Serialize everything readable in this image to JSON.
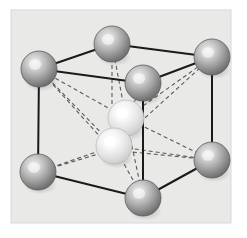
{
  "figure": {
    "name": "crystal-unit-cell-diagram",
    "canvas": {
      "width": 247,
      "height": 238
    },
    "background_color": "#ffffff",
    "panel": {
      "x": 11,
      "y": 10,
      "width": 220,
      "height": 213,
      "fill": "#e9e9e7",
      "stroke": "#d8d8d6"
    }
  },
  "style": {
    "solid_edge_color": "#1a1a1a",
    "solid_edge_width": 2.0,
    "dashed_edge_color": "#5a5a5a",
    "dashed_edge_width": 1.1,
    "dash_pattern": "4 3",
    "corner_atom_color_light": "#e2e2e2",
    "corner_atom_color_mid": "#a8a8a8",
    "corner_atom_color_dark": "#6e6e6e",
    "corner_atom_rim": "#5c5c5c",
    "interior_atom_color_light": "#ffffff",
    "interior_atom_color_mid": "#ebebeb",
    "interior_atom_color_dark": "#c4c4c4",
    "interior_atom_rim": "#b6b6b6",
    "shadow_color": "#00000022"
  },
  "atoms": [
    {
      "id": "corner-back-left",
      "label": "corner atom back left",
      "cx": 39,
      "cy": 69,
      "r": 18,
      "kind": "corner"
    },
    {
      "id": "corner-back-top",
      "label": "corner atom back top",
      "cx": 112,
      "cy": 44,
      "r": 18,
      "kind": "corner"
    },
    {
      "id": "corner-back-right",
      "label": "corner atom back right",
      "cx": 212,
      "cy": 57,
      "r": 18,
      "kind": "corner"
    },
    {
      "id": "corner-front-top",
      "label": "corner atom front top",
      "cx": 143,
      "cy": 83,
      "r": 18,
      "kind": "corner"
    },
    {
      "id": "corner-front-left",
      "label": "corner atom front left",
      "cx": 38,
      "cy": 172,
      "r": 18,
      "kind": "corner"
    },
    {
      "id": "corner-front-bottom",
      "label": "corner atom front bottom",
      "cx": 143,
      "cy": 198,
      "r": 18,
      "kind": "corner"
    },
    {
      "id": "corner-front-right",
      "label": "corner atom front right",
      "cx": 212,
      "cy": 160,
      "r": 18,
      "kind": "corner"
    },
    {
      "id": "corner-hidden-back",
      "label": "corner atom hidden back",
      "cx": 112,
      "cy": 130,
      "r": 0,
      "kind": "hidden"
    },
    {
      "id": "interior-upper",
      "label": "interior atom upper",
      "cx": 126,
      "cy": 118,
      "r": 18,
      "kind": "interior"
    },
    {
      "id": "interior-lower",
      "label": "interior atom lower",
      "cx": 114,
      "cy": 146,
      "r": 18,
      "kind": "interior"
    }
  ],
  "solid_edges": [
    {
      "id": "edge-back-left-to-back-top",
      "x1": 39,
      "y1": 69,
      "x2": 112,
      "y2": 44
    },
    {
      "id": "edge-back-top-to-back-right",
      "x1": 112,
      "y1": 44,
      "x2": 212,
      "y2": 57
    },
    {
      "id": "edge-back-left-to-front-top",
      "x1": 39,
      "y1": 69,
      "x2": 143,
      "y2": 83
    },
    {
      "id": "edge-front-top-to-back-right",
      "x1": 143,
      "y1": 83,
      "x2": 212,
      "y2": 57
    },
    {
      "id": "edge-back-left-vertical",
      "x1": 39,
      "y1": 69,
      "x2": 38,
      "y2": 172
    },
    {
      "id": "edge-front-top-vertical",
      "x1": 143,
      "y1": 83,
      "x2": 143,
      "y2": 198
    },
    {
      "id": "edge-back-right-vertical",
      "x1": 212,
      "y1": 57,
      "x2": 212,
      "y2": 160
    },
    {
      "id": "edge-front-left-to-front-bottom",
      "x1": 38,
      "y1": 172,
      "x2": 143,
      "y2": 198
    },
    {
      "id": "edge-front-bottom-to-front-right",
      "x1": 143,
      "y1": 198,
      "x2": 212,
      "y2": 160
    }
  ],
  "dashed_edges": [
    {
      "id": "hidden-edge-back-top-vertical",
      "x1": 112,
      "y1": 44,
      "x2": 112,
      "y2": 150
    },
    {
      "id": "hidden-edge-back-left-to-hidden",
      "x1": 39,
      "y1": 69,
      "x2": 112,
      "y2": 150
    },
    {
      "id": "hidden-edge-hidden-to-back-right",
      "x1": 112,
      "y1": 150,
      "x2": 212,
      "y2": 160
    },
    {
      "id": "hidden-edge-front-left-to-hidden",
      "x1": 38,
      "y1": 172,
      "x2": 112,
      "y2": 150
    },
    {
      "id": "bond-upper-to-back-left",
      "x1": 126,
      "y1": 118,
      "x2": 39,
      "y2": 69
    },
    {
      "id": "bond-upper-to-back-top",
      "x1": 126,
      "y1": 118,
      "x2": 112,
      "y2": 44
    },
    {
      "id": "bond-upper-to-back-right",
      "x1": 126,
      "y1": 118,
      "x2": 212,
      "y2": 57
    },
    {
      "id": "bond-upper-to-front-top",
      "x1": 126,
      "y1": 118,
      "x2": 143,
      "y2": 83
    },
    {
      "id": "bond-upper-to-front-right",
      "x1": 126,
      "y1": 118,
      "x2": 212,
      "y2": 160
    },
    {
      "id": "bond-upper-to-front-bottom",
      "x1": 126,
      "y1": 118,
      "x2": 143,
      "y2": 198
    },
    {
      "id": "bond-lower-to-back-left",
      "x1": 114,
      "y1": 146,
      "x2": 39,
      "y2": 69
    },
    {
      "id": "bond-lower-to-front-left",
      "x1": 114,
      "y1": 146,
      "x2": 38,
      "y2": 172
    },
    {
      "id": "bond-lower-to-front-right",
      "x1": 114,
      "y1": 146,
      "x2": 212,
      "y2": 160
    },
    {
      "id": "bond-lower-to-front-bottom",
      "x1": 114,
      "y1": 146,
      "x2": 143,
      "y2": 198
    },
    {
      "id": "bond-lower-to-front-top",
      "x1": 114,
      "y1": 146,
      "x2": 143,
      "y2": 83
    },
    {
      "id": "bond-lower-to-back-right",
      "x1": 114,
      "y1": 146,
      "x2": 212,
      "y2": 57
    }
  ]
}
